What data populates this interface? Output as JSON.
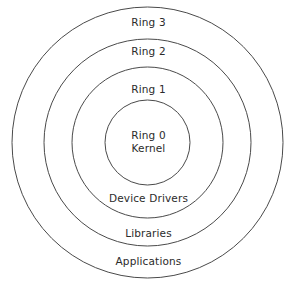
{
  "diagram": {
    "type": "concentric-circles",
    "stroke_color": "#444444",
    "fill_color": "#ffffff",
    "text_color": "#2b2b2b",
    "center": {
      "x": 147.5,
      "y": 142.5
    },
    "circles": [
      {
        "name": "outer-ring-circle",
        "diameter": 271,
        "label": "Ring 3"
      },
      {
        "name": "third-ring-circle",
        "diameter": 207,
        "label": "Ring 2"
      },
      {
        "name": "second-ring-circle",
        "diameter": 151,
        "label": "Ring 1"
      },
      {
        "name": "kernel-circle",
        "diameter": 85,
        "label": "Ring 0"
      }
    ],
    "labels": {
      "ring3": "Ring 3",
      "ring2": "Ring 2",
      "ring1": "Ring 1",
      "ring0": "Ring 0",
      "kernel": "Kernel",
      "device_drivers": "Device Drivers",
      "libraries": "Libraries",
      "applications": "Applications"
    }
  }
}
